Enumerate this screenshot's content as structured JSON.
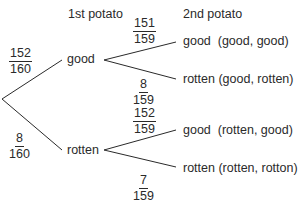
{
  "headers": {
    "first": "1st potato",
    "second": "2nd potato"
  },
  "first_level": {
    "good": {
      "label": "good",
      "prob": {
        "num": "152",
        "den": "160"
      }
    },
    "rotten": {
      "label": "rotten",
      "prob": {
        "num": "8",
        "den": "160"
      }
    }
  },
  "second_level": {
    "good_good": {
      "label": "good  (good, good)",
      "prob": {
        "num": "151",
        "den": "159"
      }
    },
    "good_rotten": {
      "label": "rotten (good, rotten)",
      "prob": {
        "num": "8",
        "den": "159"
      }
    },
    "rotten_good": {
      "label": "good  (rotten, good)",
      "prob": {
        "num": "152",
        "den": "159"
      }
    },
    "rotten_rotten": {
      "label": "rotten (rotten, rotton)",
      "prob": {
        "num": "7",
        "den": "159"
      }
    }
  },
  "line_color": "#2a2a2a"
}
